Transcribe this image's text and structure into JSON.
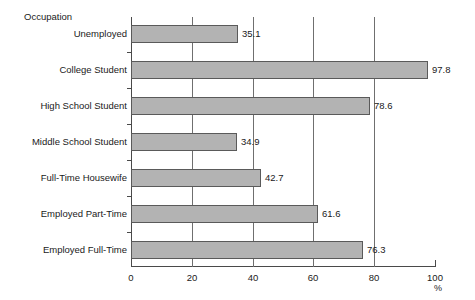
{
  "chart_data": {
    "type": "bar",
    "orientation": "horizontal",
    "title": "",
    "ylabel": "Occupation",
    "xlabel": "%",
    "categories": [
      "Unemployed",
      "College Student",
      "High School Student",
      "Middle School Student",
      "Full-Time Housewife",
      "Employed Part-Time",
      "Employed Full-Time"
    ],
    "values": [
      35.1,
      97.8,
      78.6,
      34.9,
      42.7,
      61.6,
      76.3
    ],
    "value_labels": [
      "35.1",
      "97.8",
      "78.6",
      "34.9",
      "42.7",
      "61.6",
      "76.3"
    ],
    "xlim": [
      0,
      100
    ],
    "xticks": [
      0,
      20,
      40,
      60,
      80,
      100
    ],
    "xtick_labels": [
      "0",
      "20",
      "40",
      "60",
      "80",
      "100"
    ],
    "grid": true,
    "grid_axis": "x",
    "legend": false,
    "bar_color": "#b3b3b3",
    "bar_border_color": "#5a5a5a",
    "axis_color": "#4a4a4a",
    "text_color": "#1a1a1a"
  }
}
